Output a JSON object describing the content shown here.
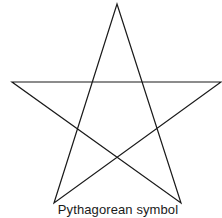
{
  "diagram": {
    "shape": "pentagram",
    "caption": "Pythagorean symbol",
    "stroke_color": "#1a1a1a",
    "points": {
      "top": [
        117,
        4
      ],
      "left": [
        12,
        82
      ],
      "right": [
        221,
        82
      ],
      "bottom_left": [
        54,
        203
      ],
      "bottom_right": [
        181,
        203
      ]
    }
  }
}
